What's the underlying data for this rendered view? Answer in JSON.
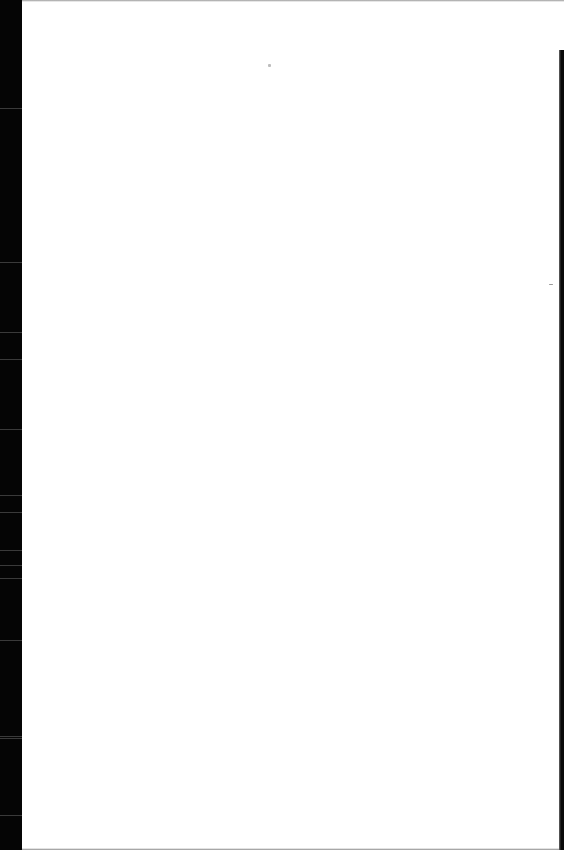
{
  "document": {
    "type": "scanned-page",
    "content": "",
    "blank": true
  },
  "scan": {
    "left_border_color": "#050505",
    "right_border_color": "#0a0a0a",
    "page_color": "#ffffff",
    "specks": [
      {
        "x": 268,
        "y": 64,
        "w": 3,
        "h": 3
      },
      {
        "x": 549,
        "y": 284,
        "w": 4,
        "h": 1
      }
    ]
  }
}
